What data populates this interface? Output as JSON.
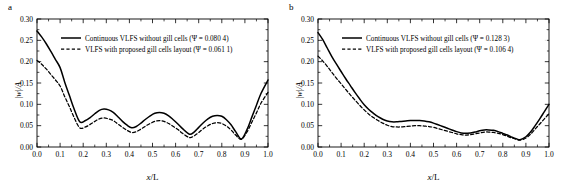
{
  "figure": {
    "panels": [
      {
        "letter": "a",
        "xlabel": "x/L",
        "ylabel": "|w|/A",
        "legend": [
          "Continuous VLFS without gill cells (Ψ = 0.080 4)",
          "VLFS with proposed gill cells layout (Ψ = 0.061 1)"
        ],
        "xticks": [
          "0.0",
          "0.1",
          "0.2",
          "0.3",
          "0.4",
          "0.5",
          "0.6",
          "0.7",
          "0.8",
          "0.9",
          "1.0"
        ],
        "yticks": [
          "0.00",
          "0.05",
          "0.10",
          "0.15",
          "0.20",
          "0.25",
          "0.30"
        ]
      },
      {
        "letter": "b",
        "xlabel": "x/L",
        "ylabel": "|w|/A",
        "legend": [
          "Continuous VLFS without gill cells (Ψ = 0.128 3)",
          "VLFS with proposed gill cells layout (Ψ = 0.106 4)"
        ],
        "xticks": [
          "0.0",
          "0.1",
          "0.2",
          "0.3",
          "0.4",
          "0.5",
          "0.6",
          "0.7",
          "0.8",
          "0.9",
          "1.0"
        ],
        "yticks": [
          "0.00",
          "0.05",
          "0.10",
          "0.15",
          "0.20",
          "0.25",
          "0.30"
        ]
      }
    ]
  },
  "chart_data": [
    {
      "type": "line",
      "title": "a",
      "xlabel": "x/L",
      "ylabel": "|w|/A",
      "xlim": [
        0.0,
        1.0
      ],
      "ylim": [
        0.0,
        0.3
      ],
      "xticks": [
        0.0,
        0.1,
        0.2,
        0.3,
        0.4,
        0.5,
        0.6,
        0.7,
        0.8,
        0.9,
        1.0
      ],
      "yticks": [
        0.0,
        0.05,
        0.1,
        0.15,
        0.2,
        0.25,
        0.3
      ],
      "grid": false,
      "legend_position": "upper-center",
      "series": [
        {
          "name": "Continuous VLFS without gill cells (Ψ = 0.080 4)",
          "style": "solid",
          "color": "#000000",
          "x": [
            0.0,
            0.02,
            0.04,
            0.06,
            0.08,
            0.1,
            0.12,
            0.14,
            0.16,
            0.185,
            0.21,
            0.23,
            0.25,
            0.27,
            0.29,
            0.31,
            0.33,
            0.35,
            0.37,
            0.39,
            0.41,
            0.43,
            0.45,
            0.47,
            0.49,
            0.51,
            0.53,
            0.55,
            0.57,
            0.59,
            0.61,
            0.63,
            0.66,
            0.68,
            0.7,
            0.72,
            0.74,
            0.76,
            0.78,
            0.8,
            0.82,
            0.84,
            0.86,
            0.885,
            0.91,
            0.93,
            0.95,
            0.97,
            1.0
          ],
          "y": [
            0.272,
            0.258,
            0.242,
            0.224,
            0.205,
            0.186,
            0.152,
            0.121,
            0.09,
            0.059,
            0.062,
            0.069,
            0.078,
            0.086,
            0.089,
            0.087,
            0.081,
            0.071,
            0.06,
            0.051,
            0.045,
            0.048,
            0.056,
            0.065,
            0.073,
            0.079,
            0.081,
            0.079,
            0.073,
            0.064,
            0.054,
            0.043,
            0.03,
            0.035,
            0.046,
            0.057,
            0.066,
            0.072,
            0.074,
            0.072,
            0.064,
            0.052,
            0.036,
            0.019,
            0.042,
            0.07,
            0.098,
            0.126,
            0.157
          ]
        },
        {
          "name": "VLFS with proposed gill cells layout (Ψ = 0.061 1)",
          "style": "dashed",
          "color": "#000000",
          "x": [
            0.0,
            0.02,
            0.04,
            0.06,
            0.08,
            0.1,
            0.12,
            0.14,
            0.16,
            0.185,
            0.21,
            0.23,
            0.25,
            0.27,
            0.29,
            0.31,
            0.33,
            0.35,
            0.37,
            0.39,
            0.41,
            0.43,
            0.45,
            0.47,
            0.49,
            0.51,
            0.53,
            0.55,
            0.57,
            0.59,
            0.61,
            0.63,
            0.66,
            0.68,
            0.7,
            0.72,
            0.74,
            0.76,
            0.78,
            0.8,
            0.82,
            0.84,
            0.86,
            0.885,
            0.91,
            0.93,
            0.95,
            0.97,
            1.0
          ],
          "y": [
            0.203,
            0.194,
            0.183,
            0.17,
            0.157,
            0.143,
            0.118,
            0.095,
            0.07,
            0.045,
            0.047,
            0.053,
            0.06,
            0.066,
            0.068,
            0.066,
            0.062,
            0.054,
            0.046,
            0.039,
            0.034,
            0.036,
            0.042,
            0.049,
            0.055,
            0.06,
            0.062,
            0.06,
            0.055,
            0.048,
            0.041,
            0.032,
            0.022,
            0.026,
            0.034,
            0.043,
            0.05,
            0.055,
            0.057,
            0.055,
            0.049,
            0.04,
            0.028,
            0.018,
            0.036,
            0.058,
            0.08,
            0.103,
            0.128
          ]
        }
      ]
    },
    {
      "type": "line",
      "title": "b",
      "xlabel": "x/L",
      "ylabel": "|w|/A",
      "xlim": [
        0.0,
        1.0
      ],
      "ylim": [
        0.0,
        0.3
      ],
      "xticks": [
        0.0,
        0.1,
        0.2,
        0.3,
        0.4,
        0.5,
        0.6,
        0.7,
        0.8,
        0.9,
        1.0
      ],
      "yticks": [
        0.0,
        0.05,
        0.1,
        0.15,
        0.2,
        0.25,
        0.3
      ],
      "grid": false,
      "legend_position": "upper-center",
      "series": [
        {
          "name": "Continuous VLFS without gill cells (Ψ = 0.128 3)",
          "style": "solid",
          "color": "#000000",
          "x": [
            0.0,
            0.02,
            0.04,
            0.06,
            0.08,
            0.1,
            0.12,
            0.14,
            0.16,
            0.18,
            0.2,
            0.22,
            0.24,
            0.26,
            0.28,
            0.3,
            0.32,
            0.34,
            0.36,
            0.38,
            0.4,
            0.42,
            0.44,
            0.46,
            0.48,
            0.5,
            0.52,
            0.54,
            0.56,
            0.58,
            0.6,
            0.62,
            0.64,
            0.66,
            0.68,
            0.7,
            0.72,
            0.74,
            0.76,
            0.78,
            0.8,
            0.82,
            0.84,
            0.86,
            0.875,
            0.9,
            0.92,
            0.94,
            0.96,
            0.98,
            1.0
          ],
          "y": [
            0.268,
            0.252,
            0.232,
            0.212,
            0.194,
            0.177,
            0.16,
            0.144,
            0.128,
            0.113,
            0.099,
            0.088,
            0.079,
            0.071,
            0.065,
            0.061,
            0.059,
            0.059,
            0.06,
            0.061,
            0.062,
            0.062,
            0.062,
            0.061,
            0.059,
            0.056,
            0.052,
            0.048,
            0.044,
            0.04,
            0.036,
            0.033,
            0.032,
            0.033,
            0.035,
            0.038,
            0.04,
            0.04,
            0.039,
            0.036,
            0.032,
            0.028,
            0.023,
            0.019,
            0.017,
            0.024,
            0.035,
            0.05,
            0.066,
            0.083,
            0.1
          ]
        },
        {
          "name": "VLFS with proposed gill cells layout (Ψ = 0.106 4)",
          "style": "dashed",
          "color": "#000000",
          "x": [
            0.0,
            0.02,
            0.04,
            0.06,
            0.08,
            0.1,
            0.12,
            0.14,
            0.16,
            0.18,
            0.2,
            0.22,
            0.24,
            0.26,
            0.28,
            0.3,
            0.32,
            0.34,
            0.36,
            0.38,
            0.4,
            0.42,
            0.44,
            0.46,
            0.48,
            0.5,
            0.52,
            0.54,
            0.56,
            0.58,
            0.6,
            0.62,
            0.64,
            0.66,
            0.68,
            0.7,
            0.72,
            0.74,
            0.76,
            0.78,
            0.8,
            0.82,
            0.84,
            0.86,
            0.875,
            0.9,
            0.92,
            0.94,
            0.96,
            0.98,
            1.0
          ],
          "y": [
            0.213,
            0.202,
            0.189,
            0.175,
            0.161,
            0.148,
            0.135,
            0.122,
            0.11,
            0.098,
            0.087,
            0.077,
            0.069,
            0.062,
            0.056,
            0.051,
            0.048,
            0.047,
            0.047,
            0.048,
            0.049,
            0.05,
            0.05,
            0.049,
            0.048,
            0.046,
            0.043,
            0.04,
            0.037,
            0.034,
            0.031,
            0.029,
            0.028,
            0.029,
            0.031,
            0.033,
            0.035,
            0.035,
            0.034,
            0.032,
            0.029,
            0.025,
            0.021,
            0.018,
            0.016,
            0.021,
            0.03,
            0.042,
            0.054,
            0.066,
            0.078
          ]
        }
      ]
    }
  ]
}
